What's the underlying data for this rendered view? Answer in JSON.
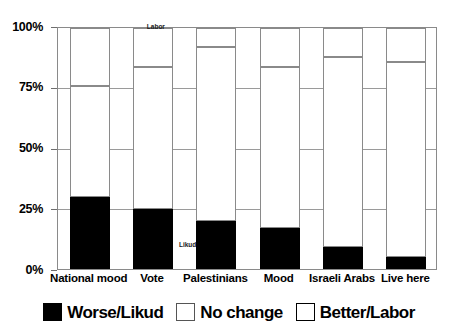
{
  "chart_data": {
    "type": "bar",
    "subtype": "stacked-100-percent",
    "title": "",
    "xlabel": "",
    "ylabel": "",
    "ylim": [
      0,
      100
    ],
    "yticks": [
      "0%",
      "25%",
      "50%",
      "75%",
      "100%"
    ],
    "ytick_values": [
      0,
      25,
      50,
      75,
      100
    ],
    "grid": true,
    "legend_position": "bottom",
    "categories": [
      "National mood",
      "Vote",
      "Palestinians",
      "Mood",
      "Israeli Arabs",
      "Live here"
    ],
    "series": [
      {
        "name": "Worse/Likud",
        "color": "#000000",
        "fill": "solid-black",
        "values": [
          30,
          25,
          20,
          17,
          9,
          5
        ]
      },
      {
        "name": "No change",
        "color": "#8f8f8f",
        "fill": "dotted",
        "values": [
          46,
          59,
          72,
          67,
          79,
          81
        ]
      },
      {
        "name": "Better/Labor",
        "color": "#ffffff",
        "fill": "white",
        "values": [
          24,
          16,
          8,
          16,
          12,
          14
        ]
      }
    ],
    "annotations": [
      {
        "text": "Labor",
        "x_pct": 23.5,
        "y_pct": 101.5,
        "size": "small"
      },
      {
        "text": "Likud",
        "x_pct": 32.0,
        "y_pct": 11.0,
        "size": "small"
      }
    ]
  },
  "legend": {
    "items": [
      {
        "label": "Worse/Likud",
        "swatch": "black"
      },
      {
        "label": "No change",
        "swatch": "dotted"
      },
      {
        "label": "Better/Labor",
        "swatch": "white"
      }
    ]
  }
}
